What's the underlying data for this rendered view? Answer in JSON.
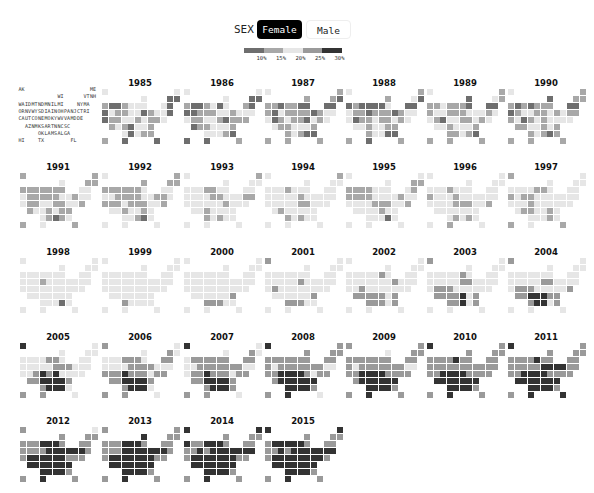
{
  "controls": {
    "sex_label": "SEX",
    "buttons": [
      {
        "label": "Female",
        "selected": true
      },
      {
        "label": "Male",
        "selected": false
      }
    ]
  },
  "legend": {
    "colors": [
      "#6e6e6e",
      "#a8a8a8",
      "#e6e6e6",
      "#9a9a9a",
      "#333333"
    ],
    "ticks": [
      "10%",
      "15%",
      "20%",
      "25%",
      "30%"
    ]
  },
  "states": [
    {
      "code": "AK",
      "r": 0,
      "c": 0
    },
    {
      "code": "ME",
      "r": 0,
      "c": 11
    },
    {
      "code": "WI",
      "r": 1,
      "c": 6
    },
    {
      "code": "VT",
      "r": 1,
      "c": 10
    },
    {
      "code": "NH",
      "r": 1,
      "c": 11
    },
    {
      "code": "WA",
      "r": 2,
      "c": 0
    },
    {
      "code": "ID",
      "r": 2,
      "c": 1
    },
    {
      "code": "MT",
      "r": 2,
      "c": 2
    },
    {
      "code": "ND",
      "r": 2,
      "c": 3
    },
    {
      "code": "MN",
      "r": 2,
      "c": 4
    },
    {
      "code": "IL",
      "r": 2,
      "c": 5
    },
    {
      "code": "MI",
      "r": 2,
      "c": 6
    },
    {
      "code": "NY",
      "r": 2,
      "c": 9
    },
    {
      "code": "MA",
      "r": 2,
      "c": 10
    },
    {
      "code": "OR",
      "r": 3,
      "c": 0
    },
    {
      "code": "NV",
      "r": 3,
      "c": 1
    },
    {
      "code": "WY",
      "r": 3,
      "c": 2
    },
    {
      "code": "SD",
      "r": 3,
      "c": 3
    },
    {
      "code": "IA",
      "r": 3,
      "c": 4
    },
    {
      "code": "IN",
      "r": 3,
      "c": 5
    },
    {
      "code": "OH",
      "r": 3,
      "c": 6
    },
    {
      "code": "PA",
      "r": 3,
      "c": 7
    },
    {
      "code": "NJ",
      "r": 3,
      "c": 8
    },
    {
      "code": "CT",
      "r": 3,
      "c": 9
    },
    {
      "code": "RI",
      "r": 3,
      "c": 10
    },
    {
      "code": "CA",
      "r": 4,
      "c": 0
    },
    {
      "code": "UT",
      "r": 4,
      "c": 1
    },
    {
      "code": "CO",
      "r": 4,
      "c": 2
    },
    {
      "code": "NE",
      "r": 4,
      "c": 3
    },
    {
      "code": "MO",
      "r": 4,
      "c": 4
    },
    {
      "code": "KY",
      "r": 4,
      "c": 5
    },
    {
      "code": "WV",
      "r": 4,
      "c": 6
    },
    {
      "code": "VA",
      "r": 4,
      "c": 7
    },
    {
      "code": "MD",
      "r": 4,
      "c": 8
    },
    {
      "code": "DE",
      "r": 4,
      "c": 9
    },
    {
      "code": "AZ",
      "r": 5,
      "c": 1
    },
    {
      "code": "NM",
      "r": 5,
      "c": 2
    },
    {
      "code": "KS",
      "r": 5,
      "c": 3
    },
    {
      "code": "AR",
      "r": 5,
      "c": 4
    },
    {
      "code": "TN",
      "r": 5,
      "c": 5
    },
    {
      "code": "NC",
      "r": 5,
      "c": 6
    },
    {
      "code": "SC",
      "r": 5,
      "c": 7
    },
    {
      "code": "OK",
      "r": 6,
      "c": 3
    },
    {
      "code": "LA",
      "r": 6,
      "c": 4
    },
    {
      "code": "MS",
      "r": 6,
      "c": 5
    },
    {
      "code": "AL",
      "r": 6,
      "c": 6
    },
    {
      "code": "GA",
      "r": 6,
      "c": 7
    },
    {
      "code": "HI",
      "r": 7,
      "c": 0
    },
    {
      "code": "TX",
      "r": 7,
      "c": 3
    },
    {
      "code": "FL",
      "r": 7,
      "c": 8
    }
  ],
  "chart_data": {
    "type": "heatmap",
    "legend_bins": [
      "<10%",
      "10-15%",
      "15-25%",
      "25-30%",
      "30%+"
    ],
    "legend_ticks": [
      "10%",
      "15%",
      "20%",
      "25%",
      "30%"
    ],
    "bin_encoding": "one digit per state in 'states' order; 0=#6e6e6e,1=#a8a8a8,2=#e6e6e6,3=#9a9a9a,4=#333333",
    "years": [
      {
        "year": "1985",
        "bins": "22200100122220021122012200112212112121022120211100"
      },
      {
        "year": "1986",
        "bins": "22200100120210001112212222112210111011222122210001"
      },
      {
        "year": "1987",
        "bins": "21110110110000102111101222012110212211222112100111"
      },
      {
        "year": "1988",
        "bins": "21120010000200211011101222011211212221221112200101"
      },
      {
        "year": "1989",
        "bins": "21021112111000122111222122102211212221222111210111"
      },
      {
        "year": "1990",
        "bins": "21011101011100012211212111201212222112212112101111"
      },
      {
        "year": "1991",
        "bins": "11211111111122211111221222112211221122121121012121"
      },
      {
        "year": "1992",
        "bins": "21111111111222221111221121112111221221221222102222"
      },
      {
        "year": "1993",
        "bins": "21222222112222222211222112222221222221222212122222"
      },
      {
        "year": "1994",
        "bins": "21222222122222222221222222222211222212222212122222"
      },
      {
        "year": "1995",
        "bins": "22211111122221111122221222222111221222212222202222"
      },
      {
        "year": "1996",
        "bins": "22222222122222122212222222222111221222222221212212"
      },
      {
        "year": "1997",
        "bins": "12222222211222121122222222221222222211221222212121"
      },
      {
        "year": "1998",
        "bins": "22222222222222222122222222222222222222222222202222"
      },
      {
        "year": "1999",
        "bins": "22222222222222222222222222222222222222222232222222"
      },
      {
        "year": "2000",
        "bins": "22222222222222222222222222222222222222222333322222"
      },
      {
        "year": "2001",
        "bins": "32222222222222222223222222322222222222222333322222"
      },
      {
        "year": "2002",
        "bins": "22222222223222222222232222232222222333332333323222"
      },
      {
        "year": "2003",
        "bins": "32222222223222222223322222333222222333342333423222"
      },
      {
        "year": "2004",
        "bins": "32222222222222222223322222333222223334443334423222"
      },
      {
        "year": "2005",
        "bins": "42222222233222222223332222234342222334444334442332"
      },
      {
        "year": "2006",
        "bins": "32232222333233222233332223334333233334444334442332"
      },
      {
        "year": "2007",
        "bins": "42232233333333223333333222334333233334444334443332"
      },
      {
        "year": "2008",
        "bins": "43333333333333323333333223344443233344444444443342"
      },
      {
        "year": "2009",
        "bins": "33233333333333323333333223344443333344444444443343"
      },
      {
        "year": "2010",
        "bins": "43333333343333333333333333344443333444444444443343"
      },
      {
        "year": "2011",
        "bins": "43333333343333333334444333344443333444444444443344"
      },
      {
        "year": "2012",
        "bins": "32333333444333333344444433444444333444444444443343"
      },
      {
        "year": "2013",
        "bins": "33433333444333333444444433444444433444444444443343"
      },
      {
        "year": "2014",
        "bins": "44333433444333334344444443444444433444444444443343"
      },
      {
        "year": "2015",
        "bins": "44333344444333334344444443444444443444444444443343"
      }
    ]
  }
}
